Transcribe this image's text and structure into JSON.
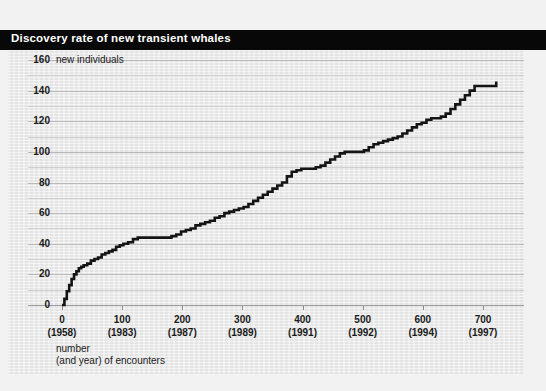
{
  "header": {
    "title": "Discovery rate of new transient whales"
  },
  "chart_data": {
    "type": "line",
    "title": "Discovery rate of new transient whales",
    "xlabel": "number\n(and year) of encounters",
    "ylabel": "new individuals",
    "ylabel_inline": "new individuals",
    "xlim": [
      0,
      730
    ],
    "ylim": [
      0,
      165
    ],
    "grid": true,
    "legend": "none",
    "y_ticks": [
      0,
      20,
      40,
      60,
      80,
      100,
      120,
      140,
      160
    ],
    "y_minor_gridlines": [
      10,
      30,
      50,
      70,
      90,
      110,
      130,
      150
    ],
    "x_ticks": [
      0,
      100,
      200,
      300,
      400,
      500,
      600,
      700
    ],
    "x_tick_years": [
      "(1958)",
      "(1983)",
      "(1987)",
      "(1989)",
      "(1991)",
      "(1992)",
      "(1994)",
      "(1997)"
    ],
    "x_tick_labels": [
      "0",
      "100",
      "200",
      "300",
      "400",
      "500",
      "600",
      "700"
    ],
    "caption_line1": "number",
    "caption_line2": "(and year) of encounters",
    "series_name": "cumulative new transient whales discovered",
    "x": [
      0,
      4,
      8,
      12,
      16,
      20,
      24,
      28,
      32,
      36,
      42,
      48,
      54,
      60,
      66,
      72,
      78,
      84,
      90,
      96,
      102,
      110,
      118,
      126,
      134,
      142,
      150,
      158,
      166,
      174,
      182,
      190,
      198,
      206,
      214,
      222,
      230,
      238,
      246,
      254,
      262,
      270,
      278,
      286,
      294,
      302,
      310,
      318,
      326,
      334,
      342,
      350,
      358,
      366,
      374,
      382,
      390,
      398,
      406,
      414,
      422,
      430,
      438,
      446,
      454,
      462,
      470,
      478,
      486,
      494,
      502,
      510,
      518,
      526,
      534,
      542,
      550,
      558,
      566,
      574,
      582,
      590,
      598,
      606,
      614,
      622,
      630,
      638,
      646,
      654,
      662,
      670,
      678,
      686,
      694,
      702,
      710,
      718,
      722
    ],
    "y": [
      0,
      4,
      9,
      13,
      17,
      20,
      22,
      24,
      25,
      26,
      27,
      29,
      30,
      31,
      33,
      34,
      35,
      36,
      38,
      39,
      40,
      41,
      43,
      44,
      44,
      44,
      44,
      44,
      44,
      44,
      45,
      46,
      48,
      49,
      50,
      52,
      53,
      54,
      55,
      57,
      58,
      60,
      61,
      62,
      63,
      64,
      66,
      68,
      70,
      72,
      74,
      76,
      78,
      80,
      84,
      87,
      88,
      89,
      89,
      89,
      90,
      91,
      93,
      95,
      97,
      99,
      100,
      100,
      100,
      100,
      101,
      103,
      105,
      106,
      107,
      108,
      109,
      110,
      112,
      114,
      116,
      118,
      119,
      121,
      122,
      122,
      123,
      125,
      128,
      131,
      134,
      137,
      140,
      143,
      143,
      143,
      143,
      143,
      146
    ]
  }
}
